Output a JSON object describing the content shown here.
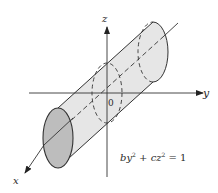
{
  "figure": {
    "type": "3d-surface-diagram",
    "axes": {
      "x_label": "x",
      "y_label": "y",
      "z_label": "z",
      "origin_label": "0"
    },
    "equation": {
      "b": "b",
      "y": "y",
      "sq1": "2",
      "plus": " + ",
      "c": "c",
      "z": "z",
      "sq2": "2",
      "rhs": " = 1",
      "full_text": "by² + cz² = 1"
    },
    "colors": {
      "surface_fill": "#e6e6e6",
      "end_cap_fill": "#bdbdbd",
      "line": "#333333"
    }
  }
}
